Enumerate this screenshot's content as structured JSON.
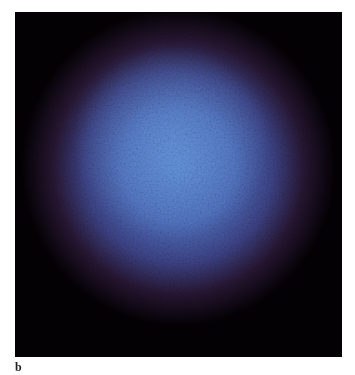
{
  "figure": {
    "panel_label": "b",
    "colors": {
      "background": "#030104",
      "center": "#5c8ad6",
      "mid": "#4c54a8",
      "edge": "#46285a",
      "page": "#ffffff"
    }
  }
}
